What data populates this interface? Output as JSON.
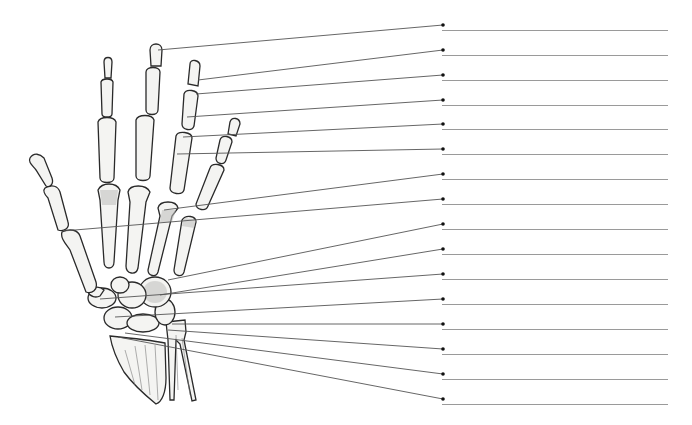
{
  "diagram": {
    "title": "",
    "colors": {
      "background": "#ffffff",
      "bone_fill": "#f4f4f2",
      "bone_outline": "#2a2a2a",
      "leader_line": "#555555",
      "answer_line": "#9a9a9a",
      "dot": "#111111"
    },
    "answer_line": {
      "x_start": 442,
      "x_end": 668
    },
    "labels": [
      {
        "id": 1,
        "text": "",
        "dot": [
          443,
          25
        ],
        "target": [
          158,
          50
        ]
      },
      {
        "id": 2,
        "text": "",
        "dot": [
          443,
          50
        ],
        "target": [
          198,
          80
        ]
      },
      {
        "id": 3,
        "text": "",
        "dot": [
          443,
          75
        ],
        "target": [
          196,
          94
        ]
      },
      {
        "id": 4,
        "text": "",
        "dot": [
          443,
          100
        ],
        "target": [
          187,
          117
        ]
      },
      {
        "id": 5,
        "text": "",
        "dot": [
          443,
          124
        ],
        "target": [
          183,
          137
        ]
      },
      {
        "id": 6,
        "text": "",
        "dot": [
          443,
          149
        ],
        "target": [
          177,
          154
        ]
      },
      {
        "id": 7,
        "text": "",
        "dot": [
          443,
          174
        ],
        "target": [
          164,
          210
        ]
      },
      {
        "id": 8,
        "text": "",
        "dot": [
          443,
          199
        ],
        "target": [
          63,
          231
        ]
      },
      {
        "id": 9,
        "text": "",
        "dot": [
          443,
          224
        ],
        "target": [
          168,
          280
        ]
      },
      {
        "id": 10,
        "text": "",
        "dot": [
          443,
          249
        ],
        "target": [
          160,
          295
        ]
      },
      {
        "id": 11,
        "text": "",
        "dot": [
          443,
          274
        ],
        "target": [
          100,
          299
        ]
      },
      {
        "id": 12,
        "text": "",
        "dot": [
          443,
          299
        ],
        "target": [
          115,
          317
        ]
      },
      {
        "id": 13,
        "text": "",
        "dot": [
          443,
          324
        ],
        "target": [
          172,
          324
        ]
      },
      {
        "id": 14,
        "text": "",
        "dot": [
          443,
          349
        ],
        "target": [
          168,
          330
        ]
      },
      {
        "id": 15,
        "text": "",
        "dot": [
          443,
          374
        ],
        "target": [
          125,
          333
        ]
      },
      {
        "id": 16,
        "text": "",
        "dot": [
          443,
          399
        ],
        "target": [
          118,
          337
        ]
      }
    ]
  }
}
